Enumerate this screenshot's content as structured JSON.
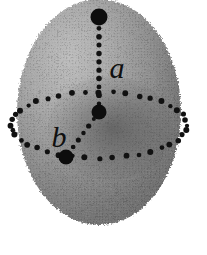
{
  "figure": {
    "name": "ellipsoid-axes-diagram",
    "caption_visible": false,
    "background_color": "#ffffff",
    "width": 207,
    "height": 255
  },
  "body": {
    "shape_name": "oblate-spheroid",
    "center": {
      "x": 99,
      "y": 112
    },
    "radius_x": 82,
    "radius_y": 113,
    "fill_light": "#b4b4b4",
    "fill_mid": "#8e8e8e",
    "fill_dark": "#5a5a5a",
    "outline_color": "#7a7a7a"
  },
  "equator": {
    "name": "equatorial-ellipse",
    "center": {
      "x": 99,
      "y": 125
    },
    "radius_x": 88,
    "radius_y": 33,
    "style": "dotted",
    "dot_color": "#111111",
    "dot_radius": 2.6,
    "dot_count": 40
  },
  "axes": [
    {
      "id": "a",
      "label": "a",
      "name": "semi-axis-a",
      "description": "polar semi-axis",
      "style": "dotted",
      "from": {
        "x": 99,
        "y": 112
      },
      "to": {
        "x": 99,
        "y": 20
      },
      "dot_color": "#111111",
      "dot_radius": 2.5,
      "dot_count": 11,
      "label_pos": {
        "x": 117,
        "y": 78
      },
      "label_size": 30
    },
    {
      "id": "b",
      "label": "b",
      "name": "semi-axis-b",
      "description": "equatorial semi-axis",
      "style": "dotted",
      "from": {
        "x": 99,
        "y": 112
      },
      "to": {
        "x": 68,
        "y": 154
      },
      "dot_color": "#111111",
      "dot_radius": 2.3,
      "dot_count": 6,
      "label_pos": {
        "x": 59,
        "y": 147
      },
      "label_size": 30
    }
  ],
  "markers": [
    {
      "id": "pole-marker",
      "name": "pole-point-marker",
      "x": 99,
      "y": 17,
      "radius": 8.5,
      "color": "#0d0d0d"
    },
    {
      "id": "center-marker",
      "name": "center-point-marker",
      "x": 99,
      "y": 112,
      "radius": 7.5,
      "color": "#0d0d0d"
    },
    {
      "id": "equator-marker",
      "name": "equator-point-marker",
      "x": 66,
      "y": 157,
      "radius": 7.5,
      "color": "#0d0d0d"
    }
  ]
}
